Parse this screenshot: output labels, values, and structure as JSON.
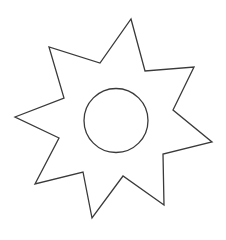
{
  "figure": {
    "stroke_color": "#3a3a3a",
    "background": "#ffffff",
    "star": {
      "points": "131,19 145,71 194,67 173,110 212,142 163,154 164,205 123,176 92,218 83,172 35,184 59,138 15,117 64,98 49,47 100,63"
    },
    "circle": {
      "cx": 116,
      "cy": 120.5,
      "r": 32
    }
  }
}
